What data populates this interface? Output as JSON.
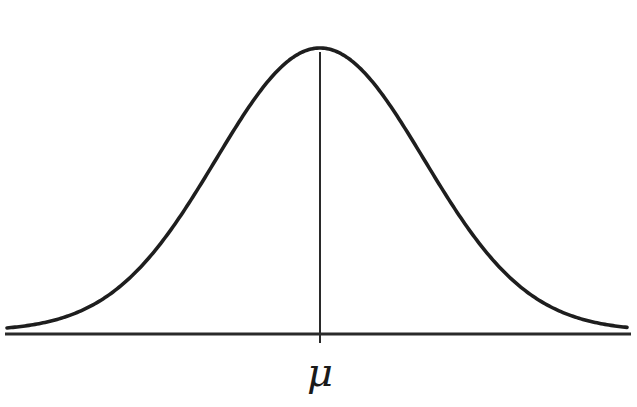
{
  "diagram": {
    "type": "normal-distribution-curve",
    "mean_label": "μ",
    "colors": {
      "background": "#ffffff",
      "curve": "#1e1e1e",
      "axis": "#2a2a2a",
      "mean_line": "#2a2a2a"
    },
    "geometry": {
      "baseline_y": 334,
      "axis_x_start": 5,
      "axis_x_end": 631,
      "mean_x": 320,
      "peak_y": 48,
      "sigma_px": 104,
      "tail_left_y": 321,
      "tail_right_y": 326,
      "mean_line_top": 52,
      "mean_line_bottom": 343
    }
  }
}
